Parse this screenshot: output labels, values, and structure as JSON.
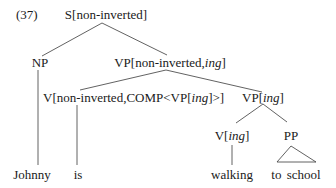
{
  "example_number": "(37)",
  "nodes": {
    "s": {
      "pre": "S[non-inverted]"
    },
    "np": {
      "pre": "NP"
    },
    "vp_top": {
      "pre": "VP[non-inverted,",
      "ital": "ing",
      "post": "]"
    },
    "v_aux": {
      "pre": "V[non-inverted,COMP<VP[",
      "ital": "ing",
      "post": "]>]"
    },
    "vp_ing": {
      "pre": "VP[",
      "ital": "ing",
      "post": "]"
    },
    "v_ing": {
      "pre": "V[",
      "ital": "ing",
      "post": "]"
    },
    "pp": {
      "pre": "PP"
    }
  },
  "leaves": {
    "johnny": "Johnny",
    "is": "is",
    "walking": "walking",
    "to_school": "to school"
  },
  "colors": {
    "line": "#333333",
    "text": "#1a1a1a"
  }
}
